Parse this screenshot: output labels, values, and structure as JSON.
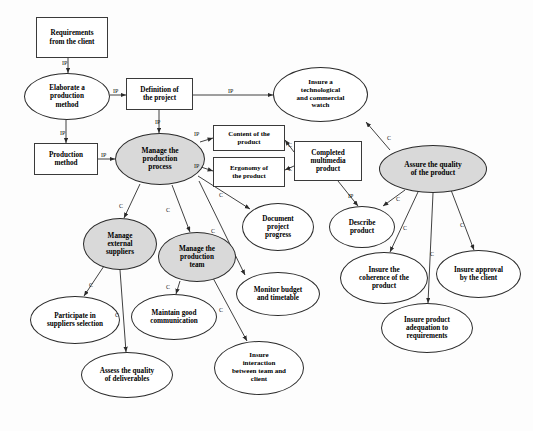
{
  "diagram": {
    "canvas": {
      "width": 533,
      "height": 431,
      "background": "#fdfdfd"
    },
    "colors": {
      "stroke": "#2b2b2b",
      "box_stroke": "#3a3a3a",
      "node_fill": "#ffffff",
      "shaded_fill": "#d9d9d9",
      "text": "#000000"
    },
    "nodes": [
      {
        "id": "requirements",
        "label": "Requirements\nfrom the client",
        "shape": "box",
        "shaded": false,
        "x": 36,
        "y": 17,
        "w": 72,
        "h": 41,
        "font": 7.2
      },
      {
        "id": "elaborate",
        "label": "Elaborate a\nproduction\nmethod",
        "shape": "ellipse",
        "shaded": false,
        "x": 24,
        "y": 73,
        "w": 86,
        "h": 47,
        "font": 7.2
      },
      {
        "id": "definition",
        "label": "Definition of\nthe project",
        "shape": "box",
        "shaded": false,
        "x": 126,
        "y": 78,
        "w": 67,
        "h": 32,
        "font": 7.2
      },
      {
        "id": "insure-watch",
        "label": "Insure a\ntechnological\nand commercial\nwatch",
        "shape": "ellipse",
        "shaded": false,
        "x": 273,
        "y": 67,
        "w": 95,
        "h": 55,
        "font": 7.0
      },
      {
        "id": "production-method",
        "label": "Production\nmethod",
        "shape": "box",
        "shaded": false,
        "x": 34,
        "y": 143,
        "w": 64,
        "h": 32,
        "font": 7.2
      },
      {
        "id": "manage-process",
        "label": "Manage the\nproduction\nprocess",
        "shape": "ellipse",
        "shaded": true,
        "x": 115,
        "y": 133,
        "w": 90,
        "h": 52,
        "font": 7.4
      },
      {
        "id": "content-product",
        "label": "Content of the\nproduct",
        "shape": "box",
        "shaded": false,
        "x": 213,
        "y": 125,
        "w": 72,
        "h": 26,
        "font": 6.8
      },
      {
        "id": "ergonomy-product",
        "label": "Ergonomy of\nthe product",
        "shape": "box",
        "shaded": false,
        "x": 213,
        "y": 157,
        "w": 72,
        "h": 30,
        "font": 6.8
      },
      {
        "id": "completed-product",
        "label": "Completed\nmultimedia\nproduct",
        "shape": "box",
        "shaded": false,
        "x": 294,
        "y": 141,
        "w": 68,
        "h": 40,
        "font": 7.2
      },
      {
        "id": "assure-quality",
        "label": "Assure the quality\nof the product",
        "shape": "ellipse",
        "shaded": true,
        "x": 379,
        "y": 145,
        "w": 108,
        "h": 48,
        "font": 7.4
      },
      {
        "id": "manage-suppliers",
        "label": "Manage\nexternal\nsuppliers",
        "shape": "ellipse",
        "shaded": true,
        "x": 83,
        "y": 218,
        "w": 74,
        "h": 52,
        "font": 7.2
      },
      {
        "id": "manage-team",
        "label": "Manage the\nproduction\nteam",
        "shape": "ellipse",
        "shaded": true,
        "x": 158,
        "y": 232,
        "w": 78,
        "h": 50,
        "font": 7.2
      },
      {
        "id": "document-progress",
        "label": "Document\nproject\nprogress",
        "shape": "ellipse",
        "shaded": false,
        "x": 242,
        "y": 203,
        "w": 72,
        "h": 48,
        "font": 7.2
      },
      {
        "id": "describe-product",
        "label": "Describe\nproduct",
        "shape": "ellipse",
        "shaded": false,
        "x": 329,
        "y": 206,
        "w": 66,
        "h": 42,
        "font": 7.2
      },
      {
        "id": "monitor-budget",
        "label": "Monitor budget\nand timetable",
        "shape": "ellipse",
        "shaded": false,
        "x": 236,
        "y": 272,
        "w": 84,
        "h": 44,
        "font": 7.2
      },
      {
        "id": "insure-coherence",
        "label": "Insure the\ncoherence of the\nproduct",
        "shape": "ellipse",
        "shaded": false,
        "x": 340,
        "y": 252,
        "w": 88,
        "h": 52,
        "font": 7.2
      },
      {
        "id": "insure-approval",
        "label": "Insure approval\nby the client",
        "shape": "ellipse",
        "shaded": false,
        "x": 436,
        "y": 250,
        "w": 85,
        "h": 48,
        "font": 7.2
      },
      {
        "id": "insure-adequation",
        "label": "Insure product\nadequation to\nrequirements",
        "shape": "ellipse",
        "shaded": false,
        "x": 381,
        "y": 303,
        "w": 92,
        "h": 50,
        "font": 7.2
      },
      {
        "id": "participate",
        "label": "Participate in\nsuppliers selection",
        "shape": "ellipse",
        "shaded": false,
        "x": 30,
        "y": 296,
        "w": 90,
        "h": 48,
        "font": 7.2
      },
      {
        "id": "maintain-comm",
        "label": "Maintain good\ncommunication",
        "shape": "ellipse",
        "shaded": false,
        "x": 131,
        "y": 294,
        "w": 86,
        "h": 46,
        "font": 7.2
      },
      {
        "id": "assess-quality",
        "label": "Assess the quality\nof deliverables",
        "shape": "ellipse",
        "shaded": false,
        "x": 81,
        "y": 352,
        "w": 92,
        "h": 46,
        "font": 7.2
      },
      {
        "id": "insure-interaction",
        "label": "Insure\ninteraction\nbetween team and\nclient",
        "shape": "ellipse",
        "shaded": false,
        "x": 214,
        "y": 341,
        "w": 90,
        "h": 54,
        "font": 7.0
      }
    ],
    "edges": [
      {
        "from": "requirements",
        "to": "elaborate",
        "label": "IP",
        "lx": 62,
        "ly": 60,
        "path": "M 68,58 L 68,73"
      },
      {
        "from": "elaborate",
        "to": "definition",
        "label": "IP",
        "lx": 113,
        "ly": 88,
        "path": "M 110,95 L 126,95"
      },
      {
        "from": "elaborate",
        "to": "production-method",
        "label": "IP",
        "lx": 60,
        "ly": 130,
        "path": "M 66,120 L 66,143"
      },
      {
        "from": "definition",
        "to": "insure-watch",
        "label": "IP",
        "lx": 228,
        "ly": 88,
        "path": "M 193,95 L 273,95"
      },
      {
        "from": "definition",
        "to": "manage-process",
        "label": "IP",
        "lx": 155,
        "ly": 119,
        "path": "M 159,110 L 159,133"
      },
      {
        "from": "production-method",
        "to": "manage-process",
        "label": "IP",
        "lx": 101,
        "ly": 152,
        "path": "M 98,159 L 115,159"
      },
      {
        "from": "manage-process",
        "to": "content-product",
        "label": "IP",
        "lx": 194,
        "ly": 131,
        "path": "M 200,142 L 213,138"
      },
      {
        "from": "manage-process",
        "to": "ergonomy-product",
        "label": "IP",
        "lx": 194,
        "ly": 163,
        "path": "M 201,167 L 213,171"
      },
      {
        "from": "manage-process",
        "to": "manage-suppliers",
        "label": "C",
        "lx": 119,
        "ly": 203,
        "path": "M 140,184 L 124,218"
      },
      {
        "from": "manage-process",
        "to": "manage-team",
        "label": "C",
        "lx": 166,
        "ly": 207,
        "path": "M 172,185 L 190,232"
      },
      {
        "from": "manage-process",
        "to": "document-progress",
        "label": "C",
        "lx": 219,
        "ly": 192,
        "path": "M 198,176 L 250,209"
      },
      {
        "from": "manage-process",
        "to": "monitor-budget",
        "label": "C",
        "lx": 211,
        "ly": 228,
        "path": "M 199,181 L 245,275"
      },
      {
        "from": "completed-product",
        "to": "content-product",
        "label": "C",
        "lx": 288,
        "ly": 142,
        "path": "M 294,152 L 285,140"
      },
      {
        "from": "completed-product",
        "to": "ergonomy-product",
        "label": "C",
        "lx": 288,
        "ly": 166,
        "path": "M 294,166 L 285,170"
      },
      {
        "from": "completed-product",
        "to": "describe-product",
        "label": "IP",
        "lx": 348,
        "ly": 193,
        "path": "M 338,181 L 358,206"
      },
      {
        "from": "assure-quality",
        "to": "insure-watch",
        "label": "C",
        "lx": 387,
        "ly": 135,
        "path": "M 390,150 L 366,122"
      },
      {
        "from": "assure-quality",
        "to": "describe-product",
        "label": "C",
        "lx": 396,
        "ly": 196,
        "path": "M 405,190 L 383,206"
      },
      {
        "from": "assure-quality",
        "to": "insure-coherence",
        "label": "C",
        "lx": 403,
        "ly": 225,
        "path": "M 418,192 L 390,252"
      },
      {
        "from": "assure-quality",
        "to": "insure-adequation",
        "label": "C",
        "lx": 430,
        "ly": 251,
        "path": "M 433,193 L 428,303"
      },
      {
        "from": "assure-quality",
        "to": "insure-approval",
        "label": "C",
        "lx": 460,
        "ly": 222,
        "path": "M 451,190 L 474,250"
      },
      {
        "from": "manage-suppliers",
        "to": "participate",
        "label": "C",
        "lx": 89,
        "ly": 282,
        "path": "M 104,266 L 84,296"
      },
      {
        "from": "manage-suppliers",
        "to": "assess-quality",
        "label": "C",
        "lx": 115,
        "ly": 312,
        "path": "M 120,270 L 126,352"
      },
      {
        "from": "manage-team",
        "to": "maintain-comm",
        "label": "C",
        "lx": 166,
        "ly": 284,
        "path": "M 180,281 L 176,294"
      },
      {
        "from": "manage-team",
        "to": "insure-interaction",
        "label": "C",
        "lx": 219,
        "ly": 307,
        "path": "M 213,278 L 247,341"
      }
    ],
    "edge_label_types": {
      "IP": "IP",
      "C": "C"
    }
  }
}
